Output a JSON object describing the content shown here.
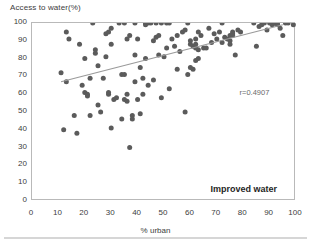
{
  "chart_data": {
    "type": "scatter",
    "title": "",
    "xlabel": "% urban",
    "ylabel": "Access to water(%)",
    "xlim": [
      0,
      100
    ],
    "ylim": [
      0,
      100
    ],
    "xticks": [
      0,
      10,
      20,
      30,
      40,
      50,
      60,
      70,
      80,
      90,
      100
    ],
    "yticks": [
      0,
      10,
      20,
      30,
      40,
      50,
      60,
      70,
      80,
      90,
      100
    ],
    "grid": false,
    "legend_position": "none",
    "series_label": "Improved water",
    "annotation": "r=0.4907",
    "correlation": 0.4907,
    "point_color": "#5b5b5b",
    "trendline_color": "#9a9a9a",
    "frame_color": "#b9b9b9",
    "trendline": {
      "x0": 11,
      "y0": 67,
      "x1": 95,
      "y1": 99
    },
    "points": [
      [
        11,
        72
      ],
      [
        12,
        40
      ],
      [
        13,
        67
      ],
      [
        13,
        95
      ],
      [
        14,
        91
      ],
      [
        16,
        48
      ],
      [
        17,
        38
      ],
      [
        18,
        88
      ],
      [
        19,
        65
      ],
      [
        20,
        80
      ],
      [
        20,
        61
      ],
      [
        21,
        60
      ],
      [
        21,
        59
      ],
      [
        22,
        69
      ],
      [
        22,
        48
      ],
      [
        23,
        100
      ],
      [
        24,
        83
      ],
      [
        24,
        85
      ],
      [
        25,
        76
      ],
      [
        25,
        54
      ],
      [
        26,
        50
      ],
      [
        27,
        69
      ],
      [
        28,
        81
      ],
      [
        28,
        94
      ],
      [
        29,
        95
      ],
      [
        29,
        60
      ],
      [
        29,
        61
      ],
      [
        30,
        88
      ],
      [
        30,
        41
      ],
      [
        30,
        97
      ],
      [
        31,
        57
      ],
      [
        32,
        58
      ],
      [
        33,
        100
      ],
      [
        34,
        71
      ],
      [
        34,
        46
      ],
      [
        35,
        71
      ],
      [
        35,
        57
      ],
      [
        35,
        100
      ],
      [
        36,
        91
      ],
      [
        36,
        56
      ],
      [
        36,
        60
      ],
      [
        37,
        30
      ],
      [
        37,
        93
      ],
      [
        38,
        48
      ],
      [
        38,
        46
      ],
      [
        39,
        100
      ],
      [
        39,
        82
      ],
      [
        39,
        67
      ],
      [
        40,
        91
      ],
      [
        40,
        57
      ],
      [
        41,
        75
      ],
      [
        41,
        49
      ],
      [
        42,
        69
      ],
      [
        42,
        60
      ],
      [
        43,
        80
      ],
      [
        43,
        100
      ],
      [
        43,
        99
      ],
      [
        44,
        100
      ],
      [
        44,
        65
      ],
      [
        45,
        100
      ],
      [
        46,
        90
      ],
      [
        46,
        68
      ],
      [
        47,
        100
      ],
      [
        47,
        92
      ],
      [
        48,
        93
      ],
      [
        48,
        82
      ],
      [
        49,
        100
      ],
      [
        49,
        58
      ],
      [
        50,
        81
      ],
      [
        51,
        86
      ],
      [
        51,
        100
      ],
      [
        52,
        63
      ],
      [
        52,
        100
      ],
      [
        53,
        91
      ],
      [
        54,
        87
      ],
      [
        55,
        74
      ],
      [
        55,
        93
      ],
      [
        56,
        84
      ],
      [
        57,
        95
      ],
      [
        58,
        50
      ],
      [
        58,
        96
      ],
      [
        59,
        71
      ],
      [
        59,
        100
      ],
      [
        60,
        88
      ],
      [
        60,
        75
      ],
      [
        60,
        90
      ],
      [
        61,
        87
      ],
      [
        61,
        74
      ],
      [
        62,
        86
      ],
      [
        62,
        88
      ],
      [
        62,
        91
      ],
      [
        62,
        79
      ],
      [
        63,
        95
      ],
      [
        63,
        85
      ],
      [
        63,
        80
      ],
      [
        64,
        93
      ],
      [
        65,
        86
      ],
      [
        66,
        86
      ],
      [
        67,
        97
      ],
      [
        68,
        89
      ],
      [
        69,
        94
      ],
      [
        70,
        91
      ],
      [
        71,
        95
      ],
      [
        72,
        100
      ],
      [
        72,
        89
      ],
      [
        73,
        92
      ],
      [
        74,
        91
      ],
      [
        75,
        90
      ],
      [
        75,
        93
      ],
      [
        75,
        88
      ],
      [
        76,
        95
      ],
      [
        76,
        94
      ],
      [
        76,
        93
      ],
      [
        77,
        82
      ],
      [
        78,
        96
      ],
      [
        79,
        95
      ],
      [
        84,
        100
      ],
      [
        85,
        87
      ],
      [
        86,
        98
      ],
      [
        87,
        99
      ],
      [
        88,
        100
      ],
      [
        89,
        96
      ],
      [
        90,
        100
      ],
      [
        91,
        99
      ],
      [
        92,
        100
      ],
      [
        92,
        100
      ],
      [
        93,
        99
      ],
      [
        93,
        100
      ],
      [
        94,
        97
      ],
      [
        95,
        93
      ],
      [
        96,
        100
      ],
      [
        97,
        100
      ],
      [
        99,
        99
      ]
    ]
  }
}
